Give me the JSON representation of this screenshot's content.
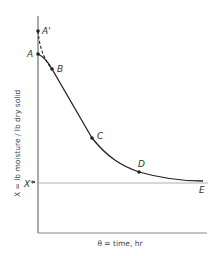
{
  "diagram": {
    "x_axis_label": "θ = time, hr",
    "y_axis_label": "X = lb moisture / lb dry solid",
    "equilibrium_label": "X*",
    "points": [
      {
        "id": "A_prime",
        "label": "A'"
      },
      {
        "id": "A",
        "label": "A"
      },
      {
        "id": "B",
        "label": "B"
      },
      {
        "id": "C",
        "label": "C"
      },
      {
        "id": "D",
        "label": "D"
      },
      {
        "id": "E",
        "label": "E"
      }
    ],
    "colors": {
      "curve": "#222222",
      "axis": "#555555",
      "equilibrium_line": "#888888",
      "background": "#ffffff"
    }
  }
}
